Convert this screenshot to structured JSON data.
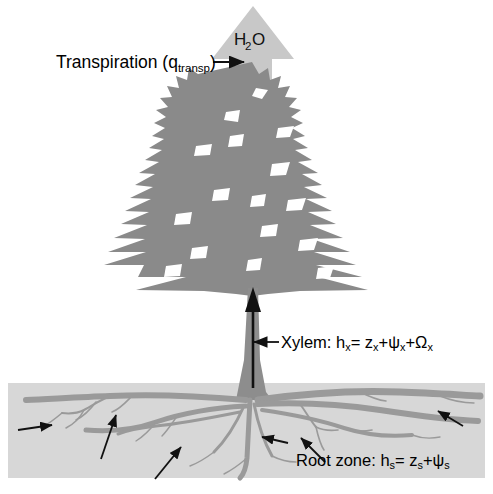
{
  "figure": {
    "type": "diagram",
    "background_color": "#ffffff"
  },
  "labels": {
    "transpiration": {
      "text_main": "Transpiration (q",
      "text_sub": "transp",
      "text_close": ")",
      "full_text": "Transpiration (qtransp)"
    },
    "h2o": {
      "h": "H",
      "two": "2",
      "o": "O",
      "full_text": "H2O"
    },
    "xylem": {
      "prefix": "Xylem: h",
      "sub1": "x",
      "eq": "= z",
      "sub2": "x",
      "plus1": "+ψ",
      "sub3": "x",
      "plus2": "+Ω",
      "sub4": "x",
      "full_text": "Xylem: hx= zx+ψx+Ωx"
    },
    "root_zone": {
      "prefix": "Root zone: h",
      "sub1": "s",
      "eq": "= z",
      "sub2": "s",
      "plus1": "+ψ",
      "sub3": "s",
      "full_text": "Root zone: hs= zs+ψs"
    }
  },
  "colors": {
    "canopy_gray": "#8a8a8a",
    "trunk_gray": "#8d8d8d",
    "root_gray": "#9a9a9a",
    "soil_panel": "#d7d7d7",
    "h2o_arrow": "#c8c8c8",
    "annotation_black": "#111111",
    "page_white": "#ffffff"
  },
  "geometry": {
    "soil_panel": {
      "x": 8,
      "y": 383,
      "width": 477,
      "height": 95
    },
    "canopy": {
      "center_x": 252,
      "top_y": 62,
      "bottom_y": 300
    },
    "trunk": {
      "x": 247,
      "top_y": 288,
      "bottom_y": 400
    },
    "h2o_arrow": {
      "center_x": 253,
      "tip_y": 6,
      "base_y": 88
    },
    "xylem_flow_arrow": {
      "x": 253,
      "tail_y": 385,
      "head_y": 291
    }
  },
  "annotation_arrows": [
    {
      "name": "transpiration-pointer",
      "x1": 215,
      "y1": 62,
      "x2": 245,
      "y2": 62,
      "direction": "right"
    },
    {
      "name": "xylem-pointer",
      "x1": 278,
      "y1": 342,
      "x2": 252,
      "y2": 342,
      "direction": "left"
    },
    {
      "name": "soil-uptake-arrow-1",
      "x1": 18,
      "y1": 430,
      "x2": 54,
      "y2": 425,
      "direction": "right"
    },
    {
      "name": "soil-uptake-arrow-2",
      "x1": 102,
      "y1": 458,
      "x2": 116,
      "y2": 414,
      "direction": "up-right"
    },
    {
      "name": "soil-uptake-arrow-3",
      "x1": 156,
      "y1": 478,
      "x2": 180,
      "y2": 446,
      "direction": "up-right"
    },
    {
      "name": "soil-uptake-arrow-4",
      "x1": 286,
      "y1": 443,
      "x2": 262,
      "y2": 436,
      "direction": "left"
    },
    {
      "name": "soil-uptake-arrow-5",
      "x1": 324,
      "y1": 461,
      "x2": 300,
      "y2": 437,
      "direction": "up-left"
    },
    {
      "name": "soil-uptake-arrow-6",
      "x1": 462,
      "y1": 425,
      "x2": 437,
      "y2": 410,
      "direction": "up-left"
    }
  ]
}
